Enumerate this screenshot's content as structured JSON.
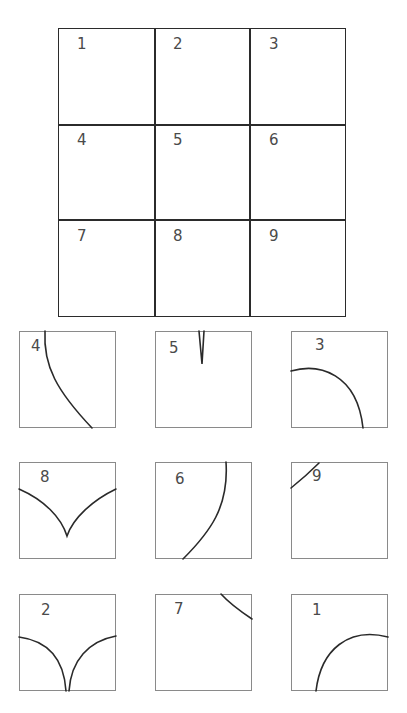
{
  "grid": {
    "rows": 3,
    "cols": 3,
    "cells": [
      "1",
      "2",
      "3",
      "4",
      "5",
      "6",
      "7",
      "8",
      "9"
    ]
  },
  "pieces": [
    {
      "label": "4",
      "left": 19,
      "top": 331,
      "labelX": 11,
      "labelY": 5,
      "paths": [
        "M26,0 C24,35 38,60 73,97"
      ]
    },
    {
      "label": "5",
      "left": 155,
      "top": 331,
      "labelX": 13,
      "labelY": 7,
      "paths": [
        "M44,0 L47,33 L49,0"
      ]
    },
    {
      "label": "3",
      "left": 291,
      "top": 331,
      "labelX": 23,
      "labelY": 4,
      "paths": [
        "M0,40 C28,32 66,42 72,97"
      ]
    },
    {
      "label": "8",
      "left": 19,
      "top": 462,
      "labelX": 20,
      "labelY": 5,
      "paths": [
        "M0,27 C25,38 42,55 48,74 C54,56 74,38 97,27"
      ]
    },
    {
      "label": "6",
      "left": 155,
      "top": 462,
      "labelX": 19,
      "labelY": 7,
      "paths": [
        "M71,0 C74,45 55,70 28,97"
      ]
    },
    {
      "label": "9",
      "left": 291,
      "top": 462,
      "labelX": 20,
      "labelY": 4,
      "paths": [
        "M0,26 C10,18 20,9 28,1"
      ]
    },
    {
      "label": "2",
      "left": 19,
      "top": 594,
      "labelX": 21,
      "labelY": 6,
      "paths": [
        "M0,43 C30,47 45,66 47,97",
        "M50,97 C52,66 70,47 97,42"
      ]
    },
    {
      "label": "7",
      "left": 155,
      "top": 594,
      "labelX": 18,
      "labelY": 5,
      "paths": [
        "M66,0 C75,10 85,17 97,25"
      ]
    },
    {
      "label": "1",
      "left": 291,
      "top": 594,
      "labelX": 20,
      "labelY": 6,
      "paths": [
        "M25,97 C30,55 58,33 97,43"
      ]
    }
  ],
  "colors": {
    "grid_line": "#2b2b2b",
    "piece_border": "#8a8a8a",
    "curve": "#2a2a2a",
    "label": "#4a4a4a"
  }
}
